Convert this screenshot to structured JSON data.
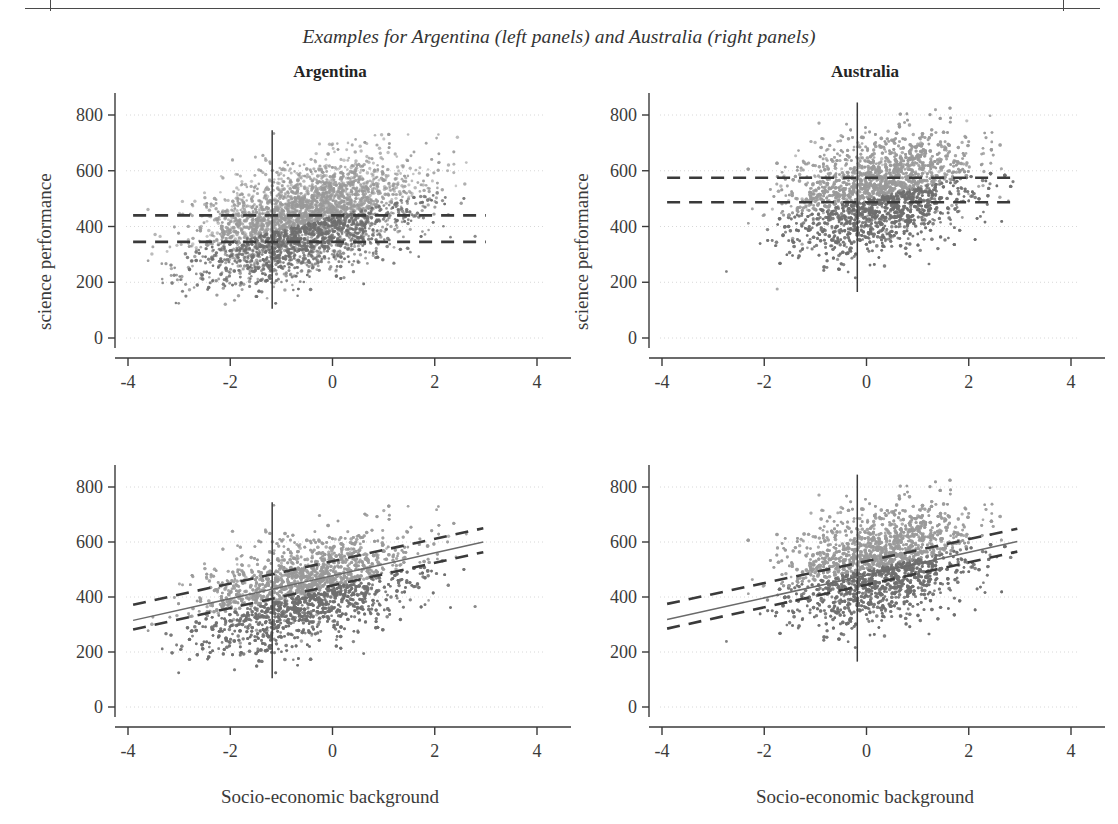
{
  "figure": {
    "caption": "Examples for Argentina (left panels) and Australia (right panels)",
    "ylabel": "science performance",
    "xlabel": "Socio-economic background"
  },
  "chart_data": {
    "type": "scatter",
    "title": "Examples for Argentina (left panels) and Australia (right panels)",
    "xlabel": "Socio-economic background",
    "ylabel": "science performance",
    "xlim": [
      -4.4,
      4.4
    ],
    "ylim": [
      -40,
      880
    ],
    "xticks": [
      -4,
      -2,
      0,
      2,
      4
    ],
    "yticks": [
      0,
      200,
      400,
      600,
      800
    ],
    "xtick_labels": [
      "-4",
      "-2",
      "0",
      "2",
      "4"
    ],
    "ytick_labels": [
      "0",
      "200",
      "400",
      "600",
      "800"
    ],
    "grid": "horizontal-dotted",
    "legend": "none",
    "point_colors": {
      "high": "#9a9a9a",
      "low": "#6f6f6f"
    },
    "line_color": "#3a3a3a",
    "panels": [
      {
        "id": "argentina-top",
        "title": "Argentina",
        "row": 0,
        "col": 0,
        "n_points": 4300,
        "cloud": {
          "x_mean": -0.55,
          "x_sd": 1.05,
          "x_min": -3.9,
          "x_max": 3.0,
          "y_mean": 395,
          "y_sd": 90,
          "y_min": 100,
          "y_max": 750,
          "slope": 45,
          "intercept": 420
        },
        "vline_x": -1.18,
        "vline_y_range": [
          105,
          745
        ],
        "fit_lines": [
          {
            "style": "dashed",
            "label": "upper-horizontal-mean",
            "x": [
              -3.9,
              3.0
            ],
            "y": [
              440,
              440
            ]
          },
          {
            "style": "dashed",
            "label": "lower-horizontal-mean",
            "x": [
              -3.9,
              3.0
            ],
            "y": [
              345,
              345
            ]
          }
        ]
      },
      {
        "id": "australia-top",
        "title": "Australia",
        "row": 0,
        "col": 1,
        "n_points": 4300,
        "cloud": {
          "x_mean": 0.25,
          "x_sd": 0.88,
          "x_min": -3.9,
          "x_max": 2.9,
          "y_mean": 530,
          "y_sd": 95,
          "y_min": 165,
          "y_max": 845,
          "slope": 40,
          "intercept": 520
        },
        "vline_x": -0.18,
        "vline_y_range": [
          165,
          845
        ],
        "fit_lines": [
          {
            "style": "dashed",
            "label": "upper-horizontal-mean",
            "x": [
              -3.9,
              2.9
            ],
            "y": [
              575,
              575
            ]
          },
          {
            "style": "dashed",
            "label": "lower-horizontal-mean",
            "x": [
              -3.9,
              2.9
            ],
            "y": [
              487,
              487
            ]
          }
        ]
      },
      {
        "id": "argentina-bottom",
        "title": "",
        "row": 1,
        "col": 0,
        "n_points": 4300,
        "cloud": {
          "x_mean": -0.55,
          "x_sd": 1.05,
          "x_min": -3.9,
          "x_max": 3.0,
          "y_mean": 395,
          "y_sd": 90,
          "y_min": 100,
          "y_max": 750,
          "slope": 45,
          "intercept": 420
        },
        "vline_x": -1.18,
        "vline_y_range": [
          105,
          745
        ],
        "fit_lines": [
          {
            "style": "solid",
            "label": "regression-fit",
            "x": [
              -3.9,
              2.95
            ],
            "y": [
              315,
              600
            ]
          },
          {
            "style": "dashed",
            "label": "upper-confidence-band",
            "x": [
              -3.9,
              2.95
            ],
            "y": [
              372,
              650
            ]
          },
          {
            "style": "dashed",
            "label": "lower-confidence-band",
            "x": [
              -3.9,
              2.95
            ],
            "y": [
              282,
              563
            ]
          }
        ]
      },
      {
        "id": "australia-bottom",
        "title": "",
        "row": 1,
        "col": 1,
        "n_points": 4300,
        "cloud": {
          "x_mean": 0.25,
          "x_sd": 0.88,
          "x_min": -3.9,
          "x_max": 2.9,
          "y_mean": 530,
          "y_sd": 95,
          "y_min": 165,
          "y_max": 845,
          "slope": 40,
          "intercept": 520
        },
        "vline_x": -0.18,
        "vline_y_range": [
          165,
          845
        ],
        "fit_lines": [
          {
            "style": "solid",
            "label": "regression-fit",
            "x": [
              -3.9,
              2.95
            ],
            "y": [
              318,
              602
            ]
          },
          {
            "style": "dashed",
            "label": "upper-confidence-band",
            "x": [
              -3.9,
              2.95
            ],
            "y": [
              375,
              648
            ]
          },
          {
            "style": "dashed",
            "label": "lower-confidence-band",
            "x": [
              -3.9,
              2.95
            ],
            "y": [
              285,
              565
            ]
          }
        ]
      }
    ]
  },
  "panel_titles": {
    "left": "Argentina",
    "right": "Australia"
  }
}
